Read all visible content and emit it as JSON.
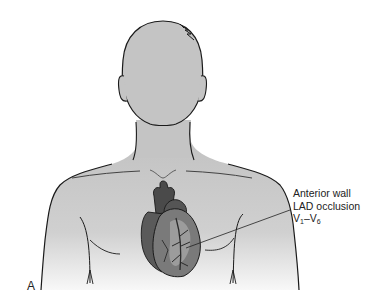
{
  "figure": {
    "panel_label": "A",
    "callout": {
      "line1": "Anterior wall",
      "line2": "LAD occlusion",
      "leads_prefix": "V",
      "leads_start_sub": "1",
      "leads_dash": "–",
      "leads_end_prefix": "V",
      "leads_end_sub": "6"
    },
    "colors": {
      "body_fill": "#c4c4c4",
      "outline": "#1a1a1a",
      "heart_dark": "#4a4a4a",
      "heart_mid": "#7a7a7a",
      "heart_light": "#a8a8a8"
    }
  }
}
